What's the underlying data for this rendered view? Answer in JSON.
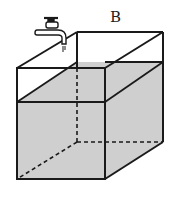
{
  "figure": {
    "labels": {
      "b": "B"
    },
    "colors": {
      "water": "#cfcfcf",
      "stroke": "#1a1a1a",
      "background": "#ffffff"
    }
  }
}
